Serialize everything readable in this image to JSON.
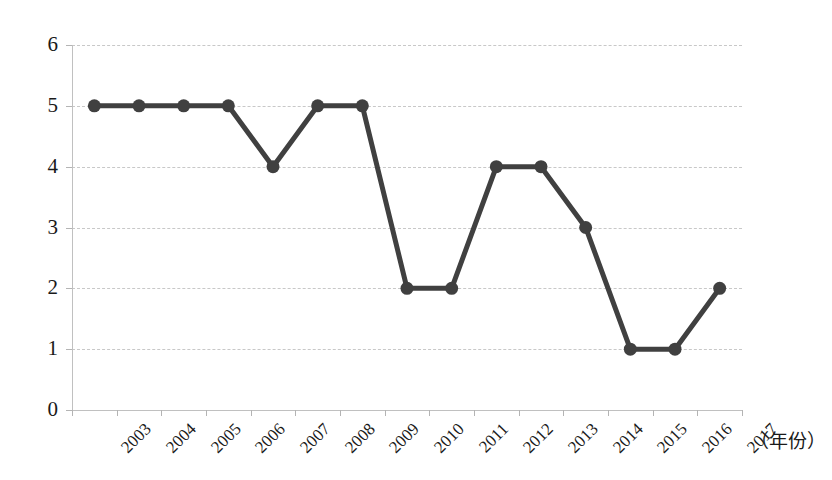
{
  "chart_data": {
    "type": "line",
    "title": "",
    "subtitle": "",
    "xlabel": "（年份）",
    "ylabel": "",
    "categories": [
      "2003",
      "2004",
      "2005",
      "2006",
      "2007",
      "2008",
      "2009",
      "2010",
      "2011",
      "2012",
      "2013",
      "2014",
      "2015",
      "2016",
      "2017"
    ],
    "values": [
      5,
      5,
      5,
      5,
      4,
      5,
      5,
      2,
      2,
      4,
      4,
      3,
      1,
      1,
      2
    ],
    "series": [
      {
        "name": "",
        "values": [
          5,
          5,
          5,
          5,
          4,
          5,
          5,
          2,
          2,
          4,
          4,
          3,
          1,
          1,
          2
        ]
      }
    ],
    "ylim": [
      0,
      6
    ],
    "y_ticks": [
      0,
      1,
      2,
      3,
      4,
      5,
      6
    ],
    "y_tick_labels": [
      "0",
      "1",
      "2",
      "3",
      "4",
      "5",
      "6"
    ],
    "grid": "horizontal-dashed",
    "legend": "none",
    "marker": "circle",
    "annotations": []
  },
  "style": {
    "line_color": "#404040",
    "marker_color": "#404040",
    "grid_color": "#c8c8c8",
    "axis_color": "#c0c0c0",
    "background": "#ffffff",
    "text_color": "#1a1a1a"
  }
}
